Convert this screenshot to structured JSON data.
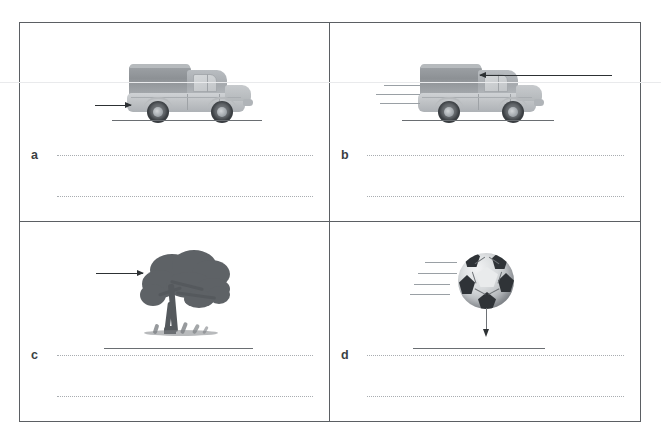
{
  "worksheet": {
    "title": "Forces worksheet — four illustrated situations with answer lines",
    "frame_color": "#5b5f63",
    "dot_color": "#a9adb1",
    "arrow_color": "#2d3134"
  },
  "panels": [
    {
      "id": "a",
      "letter": "a",
      "scene": "truck-with-forward-push-arrow",
      "illustration": "truck",
      "arrow": {
        "direction": "right",
        "target": "truck rear"
      },
      "motion_lines": 0,
      "ground_line": true,
      "answer_lines": 2,
      "answer_line_1": "",
      "answer_line_2": ""
    },
    {
      "id": "b",
      "letter": "b",
      "scene": "moving-truck-with-opposing-arrow",
      "illustration": "truck",
      "arrow": {
        "direction": "left",
        "target": "truck front"
      },
      "motion_lines": 3,
      "ground_line": true,
      "answer_lines": 2,
      "answer_line_1": "",
      "answer_line_2": ""
    },
    {
      "id": "c",
      "letter": "c",
      "scene": "tree-bending-in-wind-with-arrow",
      "illustration": "tree",
      "arrow": {
        "direction": "right",
        "target": "tree canopy"
      },
      "motion_lines": 0,
      "ground_line": true,
      "answer_lines": 2,
      "answer_line_1": "",
      "answer_line_2": ""
    },
    {
      "id": "d",
      "letter": "d",
      "scene": "soccer-ball-falling-with-downward-arrow",
      "illustration": "soccer-ball",
      "arrow": {
        "direction": "down",
        "target": "ground"
      },
      "motion_lines": 4,
      "ground_line": true,
      "answer_lines": 2,
      "answer_line_1": "",
      "answer_line_2": ""
    }
  ]
}
